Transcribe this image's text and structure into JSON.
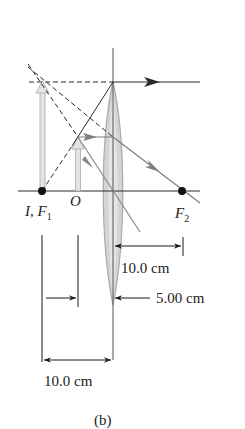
{
  "figure": {
    "caption": "(b)",
    "type": "ray diagram - converging lens, object inside focal length (virtual image)"
  },
  "labels": {
    "image_focal": "I, F",
    "image_focal_sub": "1",
    "object": "O",
    "focal2": "F",
    "focal2_sub": "2"
  },
  "dimensions": {
    "focal_length_right": "10.0 cm",
    "object_distance": "5.00 cm",
    "focal_length_left": "10.0 cm"
  },
  "colors": {
    "line": "#2a2a2a",
    "ray_gray": "#8a8a8a",
    "arrow_fill": "#d9d9d9",
    "lens_fill": "#cfcfcf",
    "dot": "#111111"
  }
}
